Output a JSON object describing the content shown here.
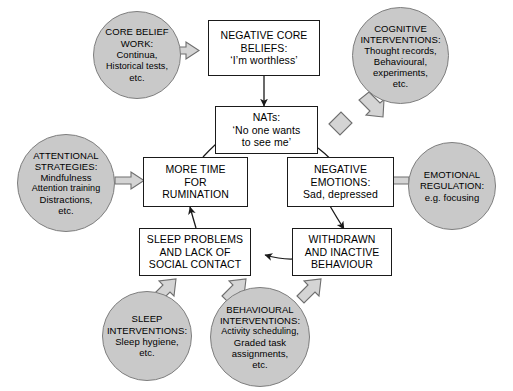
{
  "diagram": {
    "colors": {
      "circle_fill": "#c9c9c9",
      "circle_stroke": "#7e7e7e",
      "box_fill": "#ffffff",
      "box_stroke": "#1a1a1a",
      "arrow_thin": "#1a1a1a",
      "arrow_block_fill": "#d4d4d4",
      "arrow_block_stroke": "#6e6e6e",
      "background": "#ffffff"
    },
    "boxes": [
      {
        "id": "negative-core-beliefs",
        "lines": [
          "NEGATIVE CORE",
          "BELIEFS:",
          "‘I’m worthless’"
        ]
      },
      {
        "id": "nats",
        "lines": [
          "NATs:",
          "‘No one wants",
          "to see me’"
        ]
      },
      {
        "id": "more-time-for-rumination",
        "lines": [
          "MORE TIME",
          "FOR",
          "RUMINATION"
        ]
      },
      {
        "id": "negative-emotions",
        "lines": [
          "NEGATIVE",
          "EMOTIONS:",
          "Sad, depressed"
        ]
      },
      {
        "id": "sleep-problems",
        "lines": [
          "SLEEP PROBLEMS",
          "AND LACK OF",
          "SOCIAL CONTACT"
        ]
      },
      {
        "id": "withdrawn-behaviour",
        "lines": [
          "WITHDRAWN",
          "AND INACTIVE",
          "BEHAVIOUR"
        ]
      }
    ],
    "circles": [
      {
        "id": "core-belief-work",
        "lines": [
          "CORE BELIEF",
          "WORK:",
          "Continua,",
          "Historical tests,",
          "etc."
        ]
      },
      {
        "id": "cognitive-interventions",
        "lines": [
          "COGNITIVE",
          "INTERVENTIONS:",
          "Thought records,",
          "Behavioural,",
          "experiments,",
          "etc."
        ]
      },
      {
        "id": "attentional-strategies",
        "lines": [
          "ATTENTIONAL",
          "STRATEGIES:",
          "Mindfulness",
          "Attention training",
          "Distractions,",
          "etc."
        ]
      },
      {
        "id": "emotional-regulation",
        "lines": [
          "EMOTIONAL",
          "REGULATION:",
          "e.g. focusing"
        ]
      },
      {
        "id": "sleep-interventions",
        "lines": [
          "SLEEP",
          "INTERVENTIONS:",
          "Sleep hygiene,",
          "etc."
        ]
      },
      {
        "id": "behavioural-interventions",
        "lines": [
          "BEHAVIOURAL",
          "INTERVENTIONS:",
          "Activity scheduling,",
          "Graded task",
          "assignments,",
          "etc."
        ]
      }
    ],
    "connections": [
      {
        "from": "core-belief-work",
        "to": "negative-core-beliefs",
        "style": "block"
      },
      {
        "from": "negative-core-beliefs",
        "to": "nats",
        "style": "thin"
      },
      {
        "from": "cognitive-interventions",
        "to": "nats",
        "style": "block"
      },
      {
        "from": "nats",
        "to": "negative-emotions",
        "style": "thin"
      },
      {
        "from": "emotional-regulation",
        "to": "negative-emotions",
        "style": "block"
      },
      {
        "from": "negative-emotions",
        "to": "withdrawn-behaviour",
        "style": "thin"
      },
      {
        "from": "withdrawn-behaviour",
        "to": "sleep-problems",
        "style": "thin"
      },
      {
        "from": "sleep-problems",
        "to": "more-time-for-rumination",
        "style": "thin"
      },
      {
        "from": "more-time-for-rumination",
        "to": "nats",
        "style": "thin"
      },
      {
        "from": "attentional-strategies",
        "to": "more-time-for-rumination",
        "style": "block"
      },
      {
        "from": "sleep-interventions",
        "to": "sleep-problems",
        "style": "block"
      },
      {
        "from": "behavioural-interventions",
        "to": "sleep-problems",
        "style": "block"
      },
      {
        "from": "behavioural-interventions",
        "to": "withdrawn-behaviour",
        "style": "block"
      }
    ]
  }
}
